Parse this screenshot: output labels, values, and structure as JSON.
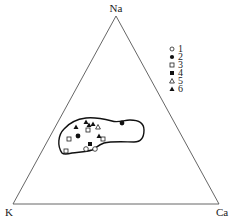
{
  "diagram": {
    "type": "ternary",
    "vertices": {
      "top": {
        "label": "Na",
        "x": 116,
        "y": 16
      },
      "left": {
        "label": "K",
        "x": 13,
        "y": 204
      },
      "right": {
        "label": "Ca",
        "x": 219,
        "y": 204
      }
    },
    "line_color": "#555555",
    "outline_color": "#111111",
    "legend": [
      {
        "label": "1",
        "marker": "circle-open"
      },
      {
        "label": "2",
        "marker": "circle-filled"
      },
      {
        "label": "3",
        "marker": "square-open"
      },
      {
        "label": "4",
        "marker": "square-filled"
      },
      {
        "label": "5",
        "marker": "triangle-open"
      },
      {
        "label": "6",
        "marker": "triangle-filled"
      }
    ],
    "points": [
      {
        "series": "1",
        "marker": "circle-open",
        "x": 86,
        "y": 149
      },
      {
        "series": "1",
        "marker": "circle-open",
        "x": 95,
        "y": 149
      },
      {
        "series": "2",
        "marker": "circle-filled",
        "x": 78,
        "y": 136
      },
      {
        "series": "2",
        "marker": "circle-filled",
        "x": 122,
        "y": 123
      },
      {
        "series": "3",
        "marker": "square-open",
        "x": 69,
        "y": 139
      },
      {
        "series": "3",
        "marker": "square-open",
        "x": 66,
        "y": 151
      },
      {
        "series": "3",
        "marker": "square-open",
        "x": 88,
        "y": 130
      },
      {
        "series": "3",
        "marker": "square-open",
        "x": 103,
        "y": 139
      },
      {
        "series": "4",
        "marker": "square-filled",
        "x": 90,
        "y": 144
      },
      {
        "series": "5",
        "marker": "triangle-open",
        "x": 98,
        "y": 127
      },
      {
        "series": "6",
        "marker": "triangle-filled",
        "x": 76,
        "y": 127
      },
      {
        "series": "6",
        "marker": "triangle-filled",
        "x": 86,
        "y": 122
      },
      {
        "series": "6",
        "marker": "triangle-filled",
        "x": 93,
        "y": 124
      },
      {
        "series": "6",
        "marker": "triangle-filled",
        "x": 89,
        "y": 125
      },
      {
        "series": "6",
        "marker": "triangle-filled",
        "x": 99,
        "y": 136
      }
    ],
    "field_outline": "closed curve enclosing all sample points"
  }
}
